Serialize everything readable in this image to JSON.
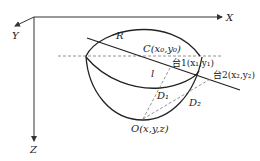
{
  "diagram": {
    "axes": {
      "x_label": "X",
      "y_label": "Y",
      "z_label": "Z"
    },
    "labels": {
      "radius": "R",
      "center": "C(x₀,y₀)",
      "station1": "台1(x₁,y₁)",
      "station2": "台2(x₂,y₂)",
      "line_l": "l",
      "distance1": "D₁",
      "distance2": "D₂",
      "origin_point": "O(x,y,z)"
    },
    "colors": {
      "stroke": "#333333",
      "dashed": "#777777",
      "background": "#ffffff"
    }
  }
}
